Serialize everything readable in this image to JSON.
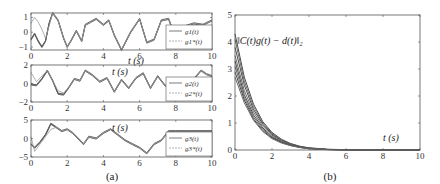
{
  "chart_data": [
    {
      "type": "line",
      "panel": "(a) top",
      "xlabel": "t (s)",
      "ylabel": "",
      "xlim": [
        0,
        10
      ],
      "ylim": [
        -1.2,
        1.3
      ],
      "xticks": [
        "0",
        "2",
        "4",
        "6",
        "8",
        "10"
      ],
      "yticks": [
        "-1",
        "0",
        "1"
      ],
      "legend": [
        "g_1(t)",
        "g_1^*(t)"
      ],
      "legend_position": "right",
      "series": [
        {
          "name": "g_1(t)",
          "style": "solid-dark-bundle",
          "x": [
            0,
            0.2,
            0.4,
            0.6,
            0.8,
            1.0,
            1.2,
            1.5,
            1.8,
            2.0,
            2.2,
            2.5,
            2.8,
            3.0,
            3.3,
            3.6,
            4.0,
            4.3,
            4.6,
            5.0,
            5.5,
            6.0,
            6.4,
            6.8,
            7.2,
            7.6,
            8.0,
            8.5,
            9.0,
            9.5,
            10
          ],
          "y": [
            -0.5,
            -0.1,
            -0.6,
            -1.0,
            -0.6,
            0.6,
            1.3,
            0.8,
            -0.4,
            -1.0,
            -0.6,
            0.1,
            -0.6,
            0.5,
            0.7,
            0.9,
            0.5,
            0.8,
            -0.2,
            -1.2,
            0.0,
            0.9,
            -0.7,
            -0.5,
            0.8,
            0.9,
            -0.4,
            0.4,
            0.6,
            0.5,
            0.8
          ]
        },
        {
          "name": "g_1^*(t)",
          "style": "dashed-light",
          "x": [
            0,
            0.2,
            0.4,
            0.6,
            0.8,
            1.0,
            1.2,
            1.5,
            1.8,
            2.0,
            2.2,
            2.5,
            2.8,
            3.0,
            3.3,
            3.6,
            4.0,
            4.3,
            4.6,
            5.0,
            5.5,
            6.0,
            6.4,
            6.8,
            7.2,
            7.6,
            8.0,
            8.5,
            9.0,
            9.5,
            10
          ],
          "y": [
            0.6,
            1.0,
            0.7,
            0.2,
            -0.4,
            0.4,
            1.3,
            0.8,
            -0.4,
            -1.0,
            -0.6,
            0.1,
            -0.6,
            0.5,
            0.7,
            0.9,
            0.5,
            0.8,
            -0.2,
            -1.2,
            0.0,
            0.9,
            -0.7,
            -0.5,
            0.8,
            0.9,
            -0.4,
            0.4,
            0.6,
            0.5,
            0.8
          ]
        }
      ]
    },
    {
      "type": "line",
      "panel": "(a) middle",
      "xlabel": "t (s)",
      "xlim": [
        0,
        10
      ],
      "ylim": [
        -2,
        2
      ],
      "xticks": [
        "0",
        "2",
        "4",
        "6",
        "8",
        "10"
      ],
      "yticks": [
        "-2",
        "0",
        "2"
      ],
      "legend": [
        "g_2(t)",
        "g_2^*(t)"
      ],
      "legend_position": "right",
      "series": [
        {
          "name": "g_2(t)",
          "style": "solid-dark-bundle",
          "x": [
            0,
            0.3,
            0.6,
            0.9,
            1.2,
            1.5,
            1.8,
            2.1,
            2.4,
            2.7,
            3.0,
            3.4,
            3.8,
            4.2,
            4.6,
            5.0,
            5.4,
            5.8,
            6.2,
            6.6,
            7.0,
            7.4,
            7.8,
            8.2,
            8.6,
            9.0,
            9.4,
            9.7,
            10
          ],
          "y": [
            -0.1,
            -0.2,
            0.5,
            1.4,
            0.3,
            -1.1,
            -1.2,
            -0.4,
            0.5,
            0.3,
            1.4,
            0.9,
            0.2,
            0.6,
            -0.9,
            0.4,
            -0.5,
            0.6,
            1.1,
            -0.5,
            0.8,
            -0.2,
            -0.6,
            0.3,
            -0.2,
            0.5,
            1.4,
            1.0,
            0.8
          ]
        },
        {
          "name": "g_2^*(t)",
          "style": "dashed-light",
          "x": [
            0,
            0.3,
            0.6,
            0.9,
            1.2,
            1.5,
            1.8,
            2.1,
            2.4,
            2.7,
            3.0,
            3.4,
            3.8,
            4.2,
            4.6,
            5.0,
            5.4,
            5.8,
            6.2,
            6.6,
            7.0,
            7.4,
            7.8,
            8.2,
            8.6,
            9.0,
            9.4,
            9.7,
            10
          ],
          "y": [
            1.2,
            0.2,
            0.8,
            1.4,
            0.3,
            -0.8,
            -1.0,
            -0.4,
            0.5,
            0.3,
            1.4,
            0.9,
            0.2,
            0.6,
            -0.9,
            0.4,
            -0.5,
            0.6,
            1.1,
            -0.5,
            0.8,
            -0.2,
            -0.6,
            0.3,
            -0.2,
            0.5,
            1.4,
            1.0,
            0.8
          ]
        }
      ]
    },
    {
      "type": "line",
      "panel": "(a) bottom",
      "xlabel": "t (s)",
      "xlim": [
        0,
        10
      ],
      "ylim": [
        -5,
        5
      ],
      "xticks": [
        "0",
        "2",
        "4",
        "6",
        "8",
        "10"
      ],
      "yticks": [
        "-5",
        "0",
        "5"
      ],
      "legend": [
        "g_3(t)",
        "g_3^*(t)"
      ],
      "legend_position": "right",
      "series": [
        {
          "name": "g_3(t)",
          "style": "solid-dark-bundle",
          "x": [
            0,
            0.2,
            0.5,
            0.8,
            1.1,
            1.4,
            1.7,
            2.0,
            2.3,
            2.6,
            2.9,
            3.2,
            3.6,
            4.0,
            4.4,
            4.8,
            5.2,
            5.6,
            6.0,
            6.4,
            6.8,
            7.2,
            7.6,
            8.0,
            8.5,
            9.0,
            9.5,
            10
          ],
          "y": [
            -1.5,
            -2.5,
            -1.0,
            1.0,
            4.0,
            3.0,
            2.0,
            2.5,
            1.5,
            0.0,
            -1.5,
            0.5,
            0.0,
            1.5,
            2.5,
            1.0,
            -0.5,
            -1.5,
            -2.5,
            -4.0,
            -1.5,
            -0.5,
            2.0,
            2.0,
            2.0,
            2.0,
            2.0,
            2.0
          ]
        },
        {
          "name": "g_3^*(t)",
          "style": "dashed-light",
          "x": [
            0,
            0.2,
            0.5,
            0.8,
            1.1,
            1.4,
            1.7,
            2.0,
            2.3,
            2.6,
            2.9,
            3.2,
            3.6,
            4.0,
            4.4,
            4.8,
            5.2,
            5.6,
            6.0,
            6.4,
            6.8,
            7.2,
            7.6,
            8.0,
            8.5,
            9.0,
            9.5,
            10
          ],
          "y": [
            0.5,
            -3.5,
            -1.5,
            0.5,
            2.5,
            3.0,
            2.0,
            2.5,
            1.5,
            0.0,
            -1.5,
            0.5,
            0.0,
            1.5,
            2.5,
            1.0,
            -0.5,
            -1.5,
            -2.5,
            -4.0,
            -1.5,
            -0.5,
            2.0,
            2.0,
            2.0,
            2.0,
            2.0,
            2.0
          ]
        }
      ]
    },
    {
      "type": "line",
      "panel": "(b)",
      "title": "",
      "annotation": "||C(t)g(t) − d(t)||₂",
      "xlabel": "t (s)",
      "xlim": [
        0,
        10
      ],
      "ylim": [
        0,
        5
      ],
      "xticks": [
        "0",
        "2",
        "4",
        "6",
        "8",
        "10"
      ],
      "yticks": [
        "0",
        "1",
        "2",
        "3",
        "4",
        "5"
      ],
      "grid": false,
      "series_description": "bundle of ~10 exponentially decaying error norms",
      "series": [
        {
          "name": "e1",
          "x": [
            0,
            0.5,
            1,
            1.5,
            2,
            2.5,
            3,
            3.5,
            4,
            5,
            6,
            8,
            10
          ],
          "y": [
            4.3,
            2.7,
            1.7,
            1.05,
            0.65,
            0.4,
            0.24,
            0.14,
            0.08,
            0.03,
            0.01,
            0,
            0
          ]
        },
        {
          "name": "e2",
          "x": [
            0,
            0.5,
            1,
            1.5,
            2,
            2.5,
            3,
            3.5,
            4,
            5,
            6,
            8,
            10
          ],
          "y": [
            4.1,
            2.55,
            1.6,
            1.0,
            0.62,
            0.38,
            0.23,
            0.13,
            0.07,
            0.02,
            0.01,
            0,
            0
          ]
        },
        {
          "name": "e3",
          "x": [
            0,
            0.5,
            1,
            1.5,
            2,
            2.5,
            3,
            3.5,
            4,
            5,
            6,
            8,
            10
          ],
          "y": [
            3.8,
            2.4,
            1.5,
            0.95,
            0.58,
            0.36,
            0.22,
            0.12,
            0.07,
            0.02,
            0.01,
            0,
            0
          ]
        },
        {
          "name": "e4",
          "x": [
            0,
            0.5,
            1,
            1.5,
            2,
            2.5,
            3,
            3.5,
            4,
            5,
            6,
            8,
            10
          ],
          "y": [
            3.5,
            2.2,
            1.4,
            0.88,
            0.55,
            0.34,
            0.2,
            0.12,
            0.06,
            0.02,
            0.01,
            0,
            0
          ]
        },
        {
          "name": "e5",
          "x": [
            0,
            0.5,
            1,
            1.5,
            2,
            2.5,
            3,
            3.5,
            4,
            5,
            6,
            8,
            10
          ],
          "y": [
            3.3,
            2.05,
            1.3,
            0.82,
            0.5,
            0.31,
            0.19,
            0.11,
            0.06,
            0.02,
            0.01,
            0,
            0
          ]
        },
        {
          "name": "e6",
          "x": [
            0,
            0.5,
            1,
            1.5,
            2,
            2.5,
            3,
            3.5,
            4,
            5,
            6,
            8,
            10
          ],
          "y": [
            3.1,
            1.95,
            1.22,
            0.77,
            0.48,
            0.3,
            0.18,
            0.1,
            0.05,
            0.02,
            0.0,
            0,
            0
          ]
        },
        {
          "name": "e7",
          "x": [
            0,
            0.5,
            1,
            1.5,
            2,
            2.5,
            3,
            3.5,
            4,
            5,
            6,
            8,
            10
          ],
          "y": [
            2.9,
            1.85,
            1.15,
            0.72,
            0.45,
            0.28,
            0.17,
            0.1,
            0.05,
            0.02,
            0.0,
            0,
            0
          ]
        },
        {
          "name": "e8",
          "x": [
            0,
            0.5,
            1,
            1.5,
            2,
            2.5,
            3,
            3.5,
            4,
            5,
            6,
            8,
            10
          ],
          "y": [
            2.7,
            1.75,
            1.1,
            0.68,
            0.42,
            0.26,
            0.16,
            0.09,
            0.05,
            0.01,
            0.0,
            0,
            0
          ]
        }
      ]
    }
  ],
  "captions": {
    "a": "(a)",
    "b": "(b)"
  },
  "labels": {
    "xlabel": "t (s)",
    "annotation_b": "‖C(t)g(t) − d(t)‖₂"
  }
}
